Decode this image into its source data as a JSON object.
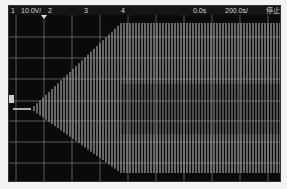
{
  "header": {
    "ch1_label": "1",
    "ch1_scale": "10.0V/",
    "ch2_label": "2",
    "ch3_label": "3",
    "ch4_label": "4",
    "time_offset": "0.0s",
    "time_scale": "200.0s/",
    "run_status": "停止"
  },
  "colors": {
    "background": "#0a0a0a",
    "grid": "#9a9a9a",
    "trace": "#e6e6e6",
    "header_text": "#d8d8d8"
  },
  "waveform": {
    "description": "burst signal: flat baseline then linearly growing oscillation envelope reaching full-scale and sustained",
    "baseline_y": 94,
    "flat_start_x": 4,
    "ramp_start_x": 22,
    "ramp_end_x": 112,
    "max_top_y": 8,
    "max_bottom_y": 158,
    "line_spacing": 3
  },
  "grid": {
    "vertical_lines_x": [
      7,
      35,
      63,
      91,
      119,
      147,
      175,
      203,
      231,
      259
    ],
    "horizontal_lines_y": [
      22,
      43,
      64,
      86,
      106,
      127,
      148
    ]
  }
}
